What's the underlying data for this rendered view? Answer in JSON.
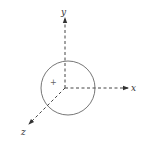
{
  "diagram": {
    "type": "3d-coordinate-axes-with-sphere",
    "axes": {
      "x": {
        "label": "x"
      },
      "y": {
        "label": "y"
      },
      "z": {
        "label": "z"
      }
    },
    "center_marker": "+",
    "colors": {
      "stroke": "#555555",
      "circle": "#666666",
      "background": "#ffffff"
    }
  }
}
